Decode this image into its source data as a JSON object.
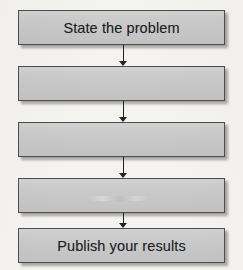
{
  "diagram": {
    "type": "flowchart",
    "orientation": "vertical",
    "colors": {
      "box_fill": "#c9c9c9",
      "box_border": "#4d4d4d",
      "text": "#1f1f1f",
      "arrow": "#222222",
      "page_background": "#f5f3f0"
    },
    "nodes": [
      {
        "id": "node-1",
        "label": "State the problem",
        "empty": false
      },
      {
        "id": "node-2",
        "label": "",
        "empty": true
      },
      {
        "id": "node-3",
        "label": "",
        "empty": true
      },
      {
        "id": "node-4",
        "label": "",
        "empty": true
      },
      {
        "id": "node-5",
        "label": "Publish your results",
        "empty": false
      }
    ],
    "connectors": [
      {
        "id": "conn-1",
        "from": "node-1",
        "to": "node-2",
        "style": "arrow-down"
      },
      {
        "id": "conn-2",
        "from": "node-2",
        "to": "node-3",
        "style": "arrow-down"
      },
      {
        "id": "conn-3",
        "from": "node-3",
        "to": "node-4",
        "style": "arrow-down"
      },
      {
        "id": "conn-4",
        "from": "node-4",
        "to": "node-5",
        "style": "arrow-down"
      }
    ]
  }
}
